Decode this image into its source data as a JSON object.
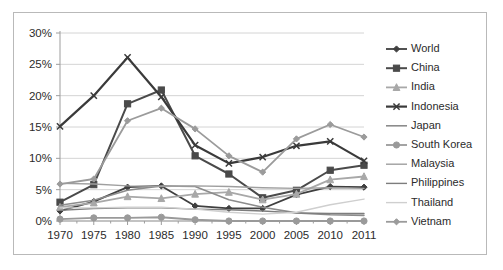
{
  "chart_data": {
    "type": "line",
    "title": "",
    "subtitle": "",
    "xlabel": "",
    "ylabel": "",
    "x": [
      "1970",
      "1975",
      "1980",
      "1985",
      "1990",
      "1995",
      "2000",
      "2005",
      "2010",
      "2011"
    ],
    "categories": [
      "1970",
      "1975",
      "1980",
      "1985",
      "1990",
      "1995",
      "2000",
      "2005",
      "2010",
      "2011"
    ],
    "ylim": [
      0,
      30
    ],
    "yticks": [
      0,
      5,
      10,
      15,
      20,
      25,
      30
    ],
    "ytick_labels": [
      "0%",
      "5%",
      "10%",
      "15%",
      "20%",
      "25%",
      "30%"
    ],
    "xtick_labels": [
      "1970",
      "1975",
      "1980",
      "1985",
      "1990",
      "1995",
      "2000",
      "2005",
      "2010",
      "2011"
    ],
    "grid": "horizontal",
    "legend_position": "right",
    "value_suffix": "%",
    "series": [
      {
        "name": "World",
        "marker": "diamond",
        "color": "#3f3f3f",
        "width": 1.8,
        "values": [
          1.6,
          3.1,
          5.4,
          5.6,
          2.4,
          2.0,
          2.0,
          4.2,
          5.5,
          5.4
        ]
      },
      {
        "name": "China",
        "marker": "square",
        "color": "#4a4a4a",
        "width": 2.0,
        "values": [
          3.0,
          5.8,
          18.7,
          20.9,
          10.4,
          7.5,
          3.7,
          4.9,
          8.1,
          8.9
        ]
      },
      {
        "name": "India",
        "marker": "triangle",
        "color": "#a8a8a8",
        "width": 1.8,
        "values": [
          2.2,
          2.9,
          3.9,
          3.6,
          4.3,
          4.6,
          3.4,
          4.3,
          6.6,
          7.1
        ]
      },
      {
        "name": "Indonesia",
        "marker": "x",
        "color": "#3a3a3a",
        "width": 2.2,
        "values": [
          15.1,
          20.0,
          26.1,
          19.8,
          12.1,
          9.2,
          10.2,
          12.0,
          12.7,
          9.6
        ]
      },
      {
        "name": "Japan",
        "marker": "none",
        "color": "#8c8c8c",
        "width": 1.6,
        "values": [
          2.5,
          3.3,
          4.9,
          5.6,
          5.5,
          3.4,
          2.2,
          1.3,
          1.0,
          0.9
        ]
      },
      {
        "name": "South Korea",
        "marker": "circle",
        "color": "#9a9a9a",
        "width": 1.8,
        "values": [
          0.3,
          0.5,
          0.5,
          0.6,
          0.2,
          0.0,
          0.0,
          0.0,
          0.0,
          0.0
        ]
      },
      {
        "name": "Malaysia",
        "marker": "none",
        "color": "#9f9f9f",
        "width": 1.4,
        "values": [
          6.0,
          5.9,
          5.6,
          5.5,
          5.6,
          5.5,
          5.3,
          5.2,
          5.3,
          5.2
        ]
      },
      {
        "name": "Philippines",
        "marker": "none",
        "color": "#7d7d7d",
        "width": 1.4,
        "values": [
          1.7,
          2.0,
          2.1,
          2.1,
          1.9,
          1.8,
          1.6,
          1.3,
          1.2,
          1.2
        ]
      },
      {
        "name": "Thailand",
        "marker": "none",
        "color": "#cfcfcf",
        "width": 1.4,
        "values": [
          2.1,
          2.1,
          2.2,
          2.2,
          1.9,
          1.4,
          1.1,
          1.4,
          2.6,
          3.5
        ]
      },
      {
        "name": "Vietnam",
        "marker": "diamond",
        "color": "#9b9b9b",
        "width": 1.8,
        "values": [
          5.9,
          6.7,
          16.0,
          18.0,
          14.7,
          10.4,
          7.8,
          13.1,
          15.4,
          13.4
        ]
      }
    ]
  },
  "legend": {
    "items": [
      {
        "label": "World"
      },
      {
        "label": "China"
      },
      {
        "label": "India"
      },
      {
        "label": "Indonesia"
      },
      {
        "label": "Japan"
      },
      {
        "label": "South Korea"
      },
      {
        "label": "Malaysia"
      },
      {
        "label": "Philippines"
      },
      {
        "label": "Thailand"
      },
      {
        "label": "Vietnam"
      }
    ]
  },
  "style": {
    "frame_color": "#b9b9b9",
    "grid_color": "#d4d4d4",
    "axis_color": "#9d9d9d",
    "text_color": "#2b2b2b",
    "background": "#ffffff"
  }
}
